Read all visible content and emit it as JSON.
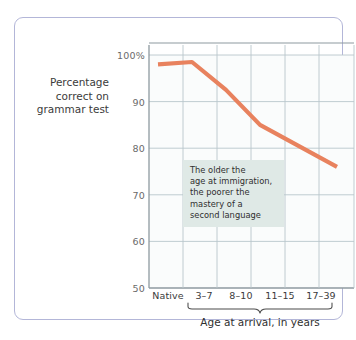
{
  "chart_data": {
    "type": "line",
    "title": "",
    "subtitle": "",
    "ylabel": "Percentage correct on grammar test",
    "xlabel": "Age at arrival, in years",
    "categories": [
      "Native",
      "3–7",
      "8–10",
      "11–15",
      "17–39"
    ],
    "values": [
      98,
      98.5,
      92.5,
      85,
      76
    ],
    "ylim": [
      50,
      100
    ],
    "yticks": [
      100,
      90,
      80,
      70,
      60,
      50
    ],
    "ytick_labels": [
      "100%",
      "90",
      "80",
      "70",
      "60",
      "50"
    ],
    "grid": true,
    "legend": "none",
    "series": [
      {
        "name": "Percentage correct on grammar test",
        "values": [
          98,
          98.5,
          92.5,
          85,
          76
        ],
        "color": "#e8825e"
      }
    ],
    "annotations": [
      {
        "name": "trend-callout",
        "lines": [
          "The older the",
          "age at immigration,",
          "the poorer the",
          "mastery of a",
          "second language"
        ]
      }
    ]
  },
  "axis": {
    "y_title_lines": [
      "Percentage",
      "correct on",
      "grammar test"
    ],
    "y_ticks": [
      "100%",
      "90",
      "80",
      "70",
      "60",
      "50"
    ],
    "x_ticks": [
      "Native",
      "3–7",
      "8–10",
      "11–15",
      "17–39"
    ],
    "x_caption": "Age at arrival, in years"
  },
  "annotation": {
    "line1": "The older the",
    "line2": "age at immigration,",
    "line3": "the poorer the",
    "line4": "mastery of a",
    "line5": "second language"
  },
  "colors": {
    "line": "#e8825e",
    "frame_border": "#b3b6d8",
    "grid": "#b9c6cc",
    "plot_background": "#fafcfc",
    "annotation_background": "#dfe9e6",
    "axis_text": "#3b3b3b",
    "tick_text": "#6a6a6a"
  }
}
